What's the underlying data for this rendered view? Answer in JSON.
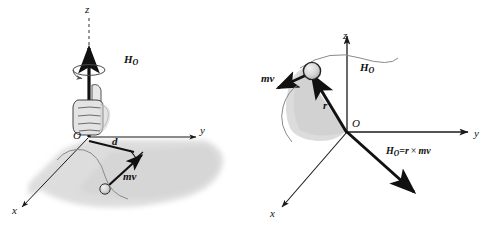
{
  "figure": {
    "colors": {
      "ink": "#111111",
      "axis": "#1a1a1a",
      "plane_fill": "#c9c9c9",
      "sweep_fill": "#d8d8d8",
      "particle_fill": "#d0d0d0",
      "hand_fill": "#e3e3e3",
      "path_line": "#8a8a8a"
    }
  },
  "left_panel": {
    "name": "right-hand-rule-panel",
    "axes": {
      "z": "z",
      "y": "y",
      "x": "x"
    },
    "origin": "O",
    "vectors": {
      "angular_momentum": {
        "symbol": "H",
        "subscript": "O"
      },
      "momentum": "mv"
    },
    "moment_arm": "d",
    "annotations": {
      "right_angle": "perpendicular-mark",
      "rotation_arrow": "curved-rotation-arrow",
      "hand": "right-hand-grip",
      "plane": "motion-plane",
      "path": "particle-path"
    }
  },
  "right_panel": {
    "name": "cross-product-panel",
    "axes": {
      "z": "z",
      "y": "y",
      "x": "x"
    },
    "origin": "O",
    "vectors": {
      "position": "r",
      "momentum": "mv",
      "angular_momentum": {
        "symbol": "H",
        "subscript": "O"
      }
    },
    "equation": {
      "lhs_symbol": "H",
      "lhs_subscript": "O",
      "equals": "=",
      "rhs_first": "r",
      "cross": "×",
      "rhs_second": "mv",
      "full": "Hₒ = r × mv"
    },
    "annotations": {
      "rotation_arrow": "curved-rotation-arrow",
      "sweep": "swept-area",
      "particle": "particle-circle"
    }
  }
}
